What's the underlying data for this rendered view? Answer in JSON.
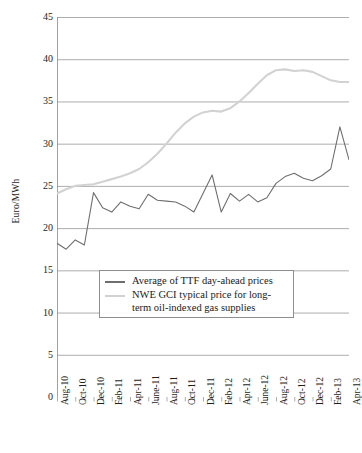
{
  "chart_data": {
    "type": "line",
    "title": "",
    "xlabel": "",
    "ylabel": "Euro/MWh",
    "ylim": [
      0,
      45
    ],
    "ytick_step": 5,
    "yticks": [
      "0",
      "5",
      "10",
      "15",
      "20",
      "25",
      "30",
      "35",
      "40",
      "45"
    ],
    "grid": true,
    "grid_axis": "y",
    "legend_position": "inside-center-lower",
    "x": [
      "Aug-10",
      "Sep-10",
      "Oct-10",
      "Nov-10",
      "Dec-10",
      "Jan-11",
      "Feb-11",
      "Mar-11",
      "Apr-11",
      "May-11",
      "June-11",
      "July-11",
      "Aug-11",
      "Sep-11",
      "Oct-11",
      "Nov-11",
      "Dec-11",
      "Jan-12",
      "Feb-12",
      "Mar-12",
      "Apr-12",
      "May-12",
      "June-12",
      "July-12",
      "Aug-12",
      "Sep-12",
      "Oct-12",
      "Nov-12",
      "Dec-12",
      "Jan-13",
      "Feb-13",
      "Mar-13",
      "Apr-13"
    ],
    "xtick_labels": [
      "Aug-10",
      "Oct-10",
      "Dec-10",
      "Feb-11",
      "Apr-11",
      "June-11",
      "Aug-11",
      "Oct-11",
      "Dec-11",
      "Feb-12",
      "Apr-12",
      "June-12",
      "Aug-12",
      "Oct-12",
      "Dec-12",
      "Feb-13",
      "Apr-13"
    ],
    "series": [
      {
        "name": "Average of  TTF day-ahead prices",
        "color": "#6e6e6e",
        "values": [
          18.2,
          17.5,
          18.6,
          18.0,
          24.2,
          22.4,
          21.9,
          23.1,
          22.6,
          22.3,
          24.0,
          23.3,
          23.2,
          23.1,
          22.6,
          21.9,
          24.1,
          26.3,
          21.9,
          24.1,
          23.2,
          24.0,
          23.1,
          23.6,
          25.3,
          26.1,
          26.5,
          25.9,
          25.6,
          26.2,
          27.0,
          32.0,
          28.1
        ]
      },
      {
        "name": "NWE GCI typical price for long-term oil-indexed gas supplies",
        "color": "#d2d2d2",
        "values": [
          24.1,
          24.6,
          25.0,
          25.1,
          25.2,
          25.5,
          25.8,
          26.1,
          26.5,
          27.0,
          27.8,
          28.8,
          30.0,
          31.3,
          32.4,
          33.2,
          33.7,
          33.9,
          33.8,
          34.2,
          35.0,
          36.0,
          37.1,
          38.1,
          38.7,
          38.8,
          38.6,
          38.7,
          38.5,
          38.0,
          37.5,
          37.3,
          37.3
        ]
      }
    ]
  },
  "legend": {
    "items": [
      {
        "label": "Average of  TTF day-ahead prices",
        "color": "#6e6e6e"
      },
      {
        "label": "NWE GCI typical price for long-",
        "color": "#d2d2d2"
      },
      {
        "label": "term oil-indexed gas supplies",
        "color": ""
      }
    ]
  }
}
